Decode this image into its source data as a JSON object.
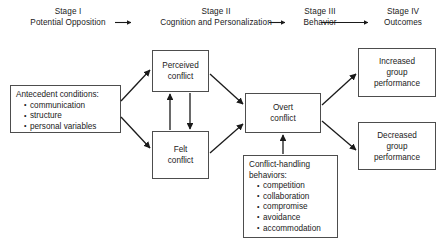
{
  "diagram": {
    "stages": [
      {
        "number": "Stage I",
        "name": "Potential Opposition"
      },
      {
        "number": "Stage II",
        "name": "Cognition and Personalization"
      },
      {
        "number": "Stage III",
        "name": "Behavior"
      },
      {
        "number": "Stage IV",
        "name": "Outcomes"
      }
    ],
    "nodes": {
      "antecedent": {
        "heading": "Antecedent conditions:",
        "items": [
          "communication",
          "structure",
          "personal variables"
        ]
      },
      "perceived": {
        "line1": "Perceived",
        "line2": "conflict"
      },
      "felt": {
        "line1": "Felt",
        "line2": "conflict"
      },
      "overt": {
        "line1": "Overt",
        "line2": "conflict"
      },
      "handling": {
        "heading_line1": "Conflict-handling",
        "heading_line2": "behaviors:",
        "items": [
          "competition",
          "collaboration",
          "compromise",
          "avoidance",
          "accommodation"
        ]
      },
      "increased": {
        "line1": "Increased",
        "line2": "group",
        "line3": "performance"
      },
      "decreased": {
        "line1": "Decreased",
        "line2": "group",
        "line3": "performance"
      }
    },
    "colors": {
      "stroke": "#4d4d4d",
      "arrow": "#1a1a1a",
      "text": "#1a1a1a",
      "background": "#ffffff"
    }
  }
}
